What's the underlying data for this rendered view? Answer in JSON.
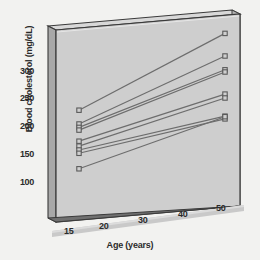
{
  "chart_data": {
    "type": "line",
    "title": "",
    "subtitle": "",
    "xlabel": "Age (years)",
    "ylabel": "Blood cholesterol (mg/dL)",
    "x": [
      15,
      50
    ],
    "xtick_labels": [
      "15",
      "20",
      "30",
      "40",
      "50"
    ],
    "xtick_values": [
      15,
      20,
      30,
      40,
      50
    ],
    "ytick_labels": [
      "100",
      "150",
      "200",
      "250",
      "300"
    ],
    "ytick_values": [
      100,
      150,
      200,
      250,
      300
    ],
    "xlim": [
      13,
      52
    ],
    "ylim": [
      90,
      360
    ],
    "grid": false,
    "legend": null,
    "marker": "open-square",
    "projection": "3d-panel",
    "series": [
      {
        "name": "subject-1",
        "values": [
          228,
          341
        ]
      },
      {
        "name": "subject-2",
        "values": [
          203,
          300
        ]
      },
      {
        "name": "subject-3",
        "values": [
          197,
          275
        ]
      },
      {
        "name": "subject-4",
        "values": [
          192,
          271
        ]
      },
      {
        "name": "subject-5",
        "values": [
          172,
          231
        ]
      },
      {
        "name": "subject-6",
        "values": [
          163,
          224
        ]
      },
      {
        "name": "subject-7",
        "values": [
          156,
          191
        ]
      },
      {
        "name": "subject-8",
        "values": [
          150,
          186
        ]
      },
      {
        "name": "subject-9",
        "values": [
          122,
          190
        ]
      }
    ],
    "colors": {
      "background": "#f2f2f0",
      "panel": "#cfcfcf",
      "panel_edge": "#3a3a3a",
      "slab_side": "#9a9a9a",
      "line": "#6d6d6d",
      "marker_edge": "#5a5a5a",
      "axis_bar": "#c9c9c9",
      "text": "#2b2b2b"
    }
  },
  "axis": {
    "y_title": "Blood cholesterol (mg/dL)",
    "x_title": "Age (years)",
    "y_ticks": [
      "300",
      "250",
      "200",
      "150",
      "100"
    ],
    "x_ticks": [
      "15",
      "20",
      "30",
      "40",
      "50"
    ]
  }
}
